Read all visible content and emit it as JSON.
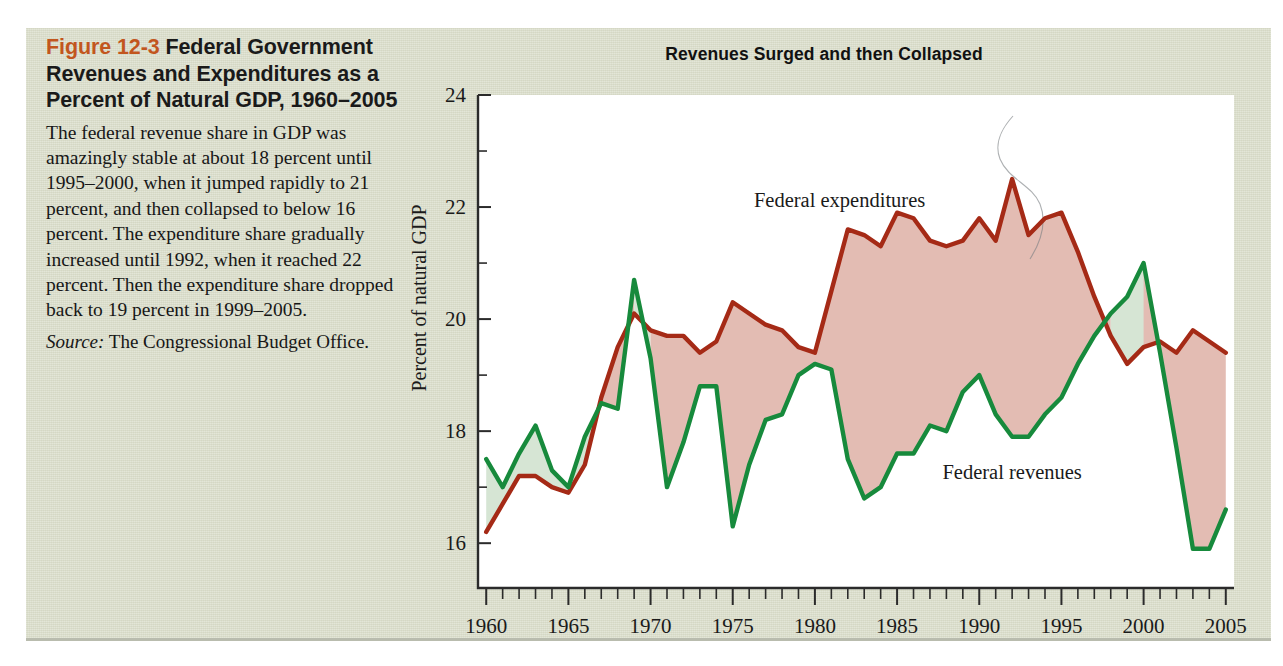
{
  "figure": {
    "number_label": "Figure 12-3",
    "title_rest": " Federal Government Revenues and Expenditures as a Percent of Natural GDP, 1960–2005",
    "body": "The federal revenue share in GDP was amazingly stable at about 18 percent until 1995–2000, when it jumped rapidly to 21 percent, and then collapsed to below 16 percent. The expenditure share gradually increased until 1992, when it reached 22 percent. Then the expenditure share dropped back to 19 percent in 1999–2005.",
    "source_label": "Source:",
    "source_text": " The Congressional Budget Office.",
    "accent_color": "#c2561e",
    "panel_color": "#d9dcc8"
  },
  "chart_data": {
    "type": "line",
    "title": "Revenues Surged and then Collapsed",
    "xlabel": "",
    "ylabel": "Percent of natural GDP",
    "xlim": [
      1959.5,
      2005.5
    ],
    "ylim": [
      15.2,
      24
    ],
    "ytick_labels": [
      "24",
      "22",
      "20",
      "18",
      "16"
    ],
    "yticks": [
      24,
      22,
      20,
      18,
      16
    ],
    "yminor": [
      23,
      21,
      19,
      17
    ],
    "xtick_labels": [
      "1960",
      "1965",
      "1970",
      "1975",
      "1980",
      "1985",
      "1990",
      "1995",
      "2000",
      "2005"
    ],
    "xticks": [
      1960,
      1965,
      1970,
      1975,
      1980,
      1985,
      1990,
      1995,
      2000,
      2005
    ],
    "grid": false,
    "legend_position": "in-plot annotations",
    "annotations": [
      {
        "text": "Federal expenditures",
        "x": 1981.5,
        "y": 22.0
      },
      {
        "text": "Federal revenues",
        "x": 1992.0,
        "y": 17.15
      }
    ],
    "x": [
      1960,
      1961,
      1962,
      1963,
      1964,
      1965,
      1966,
      1967,
      1968,
      1969,
      1970,
      1971,
      1972,
      1973,
      1974,
      1975,
      1976,
      1977,
      1978,
      1979,
      1980,
      1981,
      1982,
      1983,
      1984,
      1985,
      1986,
      1987,
      1988,
      1989,
      1990,
      1991,
      1992,
      1993,
      1994,
      1995,
      1996,
      1997,
      1998,
      1999,
      2000,
      2001,
      2002,
      2003,
      2004,
      2005
    ],
    "series": [
      {
        "name": "Federal expenditures",
        "color": "#a52a16",
        "values": [
          16.2,
          16.7,
          17.2,
          17.2,
          17.0,
          16.9,
          17.4,
          18.6,
          19.5,
          20.1,
          19.8,
          19.7,
          19.7,
          19.4,
          19.6,
          20.3,
          20.1,
          19.9,
          19.8,
          19.5,
          19.4,
          20.5,
          21.6,
          21.5,
          21.3,
          21.9,
          21.8,
          21.4,
          21.3,
          21.4,
          21.8,
          21.4,
          22.5,
          21.5,
          21.8,
          21.9,
          21.2,
          20.4,
          19.7,
          19.2,
          19.5,
          19.6,
          19.4,
          19.8,
          19.6,
          19.4
        ]
      },
      {
        "name": "Federal revenues",
        "color": "#178a3c",
        "values": [
          17.5,
          17.0,
          17.6,
          18.1,
          17.3,
          17.0,
          17.9,
          18.5,
          18.4,
          20.7,
          19.3,
          17.0,
          17.8,
          18.8,
          18.8,
          16.3,
          17.4,
          18.2,
          18.3,
          19.0,
          19.2,
          19.1,
          17.5,
          16.8,
          17.0,
          17.6,
          17.6,
          18.1,
          18.0,
          18.7,
          19.0,
          18.3,
          17.9,
          17.9,
          18.3,
          18.6,
          19.2,
          19.7,
          20.1,
          20.4,
          21.0,
          19.4,
          17.7,
          15.9,
          15.9,
          16.6
        ]
      }
    ],
    "fill_expenditures_above": "#e3bcb3",
    "fill_revenues_above": "#d6e5d4"
  }
}
